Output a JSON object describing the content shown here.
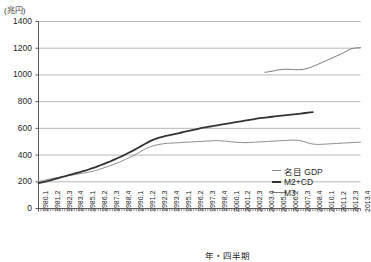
{
  "axes": {
    "y_unit_label": "(兆円)",
    "x_title": "年・四半期",
    "y_ticks": [
      "1400",
      "1200",
      "1000",
      "800",
      "600",
      "400",
      "200",
      "0"
    ]
  },
  "legend": {
    "items": [
      {
        "label": "名目 GDP",
        "key": "gdp",
        "color": "#8c8c8c"
      },
      {
        "label": "M2+CD",
        "key": "m2cd",
        "color": "#333333"
      },
      {
        "label": "M3",
        "key": "m3",
        "color": "#7a7a7a"
      }
    ]
  },
  "chart_data": {
    "type": "line",
    "title": "",
    "xlabel": "年・四半期",
    "ylabel": "(兆円)",
    "ylim": [
      0,
      1400
    ],
    "ytick_step": 200,
    "grid": true,
    "legend_position": "right-bottom",
    "x_tick_labels": [
      "1980.1",
      "1981.2",
      "1982.3",
      "1983.4",
      "1985.1",
      "1986.2",
      "1987.3",
      "1988.4",
      "1990.1",
      "1991.2",
      "1992.3",
      "1993.4",
      "1995.1",
      "1996.2",
      "1997.3",
      "1998.4",
      "2000.1",
      "2001.2",
      "2002.3",
      "2003.4",
      "2005.1",
      "2006.2",
      "2007.3",
      "2008.4",
      "2010.1",
      "2011.2",
      "2012.3",
      "2013.4"
    ],
    "x_tick_indices": [
      0,
      5,
      10,
      15,
      20,
      25,
      30,
      35,
      40,
      45,
      50,
      55,
      60,
      65,
      70,
      75,
      80,
      85,
      90,
      95,
      100,
      105,
      110,
      115,
      120,
      125,
      130,
      135
    ],
    "x_start_quarter": "1980.1",
    "x_end_quarter": "2013.4",
    "n_quarters": 136,
    "series": [
      {
        "name": "名目 GDP",
        "color": "#8c8c8c",
        "width": 1,
        "start_index": 0,
        "values": [
          202,
          206,
          210,
          214,
          218,
          222,
          226,
          229,
          232,
          235,
          238,
          241,
          244,
          247,
          250,
          253,
          256,
          259,
          262,
          265,
          268,
          272,
          276,
          280,
          285,
          290,
          296,
          302,
          308,
          314,
          320,
          327,
          334,
          341,
          348,
          356,
          364,
          372,
          380,
          389,
          398,
          408,
          418,
          428,
          438,
          448,
          456,
          463,
          469,
          474,
          478,
          481,
          484,
          486,
          488,
          489,
          490,
          491,
          492,
          493,
          494,
          495,
          496,
          497,
          498,
          499,
          500,
          501,
          502,
          503,
          504,
          505,
          506,
          507,
          508,
          508,
          507,
          506,
          505,
          503,
          501,
          499,
          497,
          496,
          495,
          494,
          493,
          493,
          494,
          495,
          496,
          497,
          498,
          499,
          500,
          501,
          502,
          503,
          504,
          505,
          506,
          507,
          508,
          509,
          510,
          511,
          512,
          512,
          511,
          509,
          506,
          502,
          497,
          491,
          486,
          483,
          481,
          480,
          480,
          481,
          482,
          483,
          484,
          485,
          486,
          487,
          488,
          489,
          490,
          491,
          492,
          493,
          494,
          495,
          496,
          497
        ]
      },
      {
        "name": "M2+CD",
        "color": "#333333",
        "width": 1.8,
        "start_index": 0,
        "values": [
          190,
          194,
          198,
          202,
          206,
          211,
          216,
          221,
          226,
          231,
          236,
          241,
          246,
          251,
          256,
          261,
          266,
          271,
          276,
          281,
          286,
          292,
          298,
          304,
          310,
          317,
          324,
          331,
          338,
          345,
          352,
          360,
          368,
          376,
          384,
          392,
          401,
          410,
          419,
          428,
          437,
          447,
          457,
          467,
          477,
          487,
          497,
          506,
          514,
          521,
          527,
          532,
          537,
          541,
          545,
          549,
          553,
          557,
          561,
          565,
          569,
          573,
          577,
          581,
          585,
          589,
          593,
          597,
          601,
          605,
          608,
          611,
          614,
          617,
          620,
          623,
          626,
          629,
          632,
          635,
          638,
          641,
          644,
          647,
          650,
          653,
          656,
          659,
          662,
          665,
          668,
          671,
          674,
          677,
          679,
          681,
          683,
          685,
          687,
          689,
          691,
          693,
          695,
          697,
          699,
          701,
          703,
          705,
          707,
          709,
          711,
          713,
          715,
          717,
          719,
          721
        ]
      },
      {
        "name": "M3",
        "color": "#7a7a7a",
        "width": 1,
        "start_index": 95,
        "values": [
          1020,
          1022,
          1025,
          1028,
          1032,
          1036,
          1038,
          1040,
          1042,
          1043,
          1042,
          1041,
          1040,
          1039,
          1039,
          1040,
          1042,
          1045,
          1050,
          1056,
          1063,
          1070,
          1078,
          1086,
          1094,
          1102,
          1110,
          1118,
          1126,
          1134,
          1142,
          1150,
          1158,
          1167,
          1176,
          1186,
          1195,
          1200,
          1202,
          1203,
          1204
        ]
      }
    ]
  }
}
